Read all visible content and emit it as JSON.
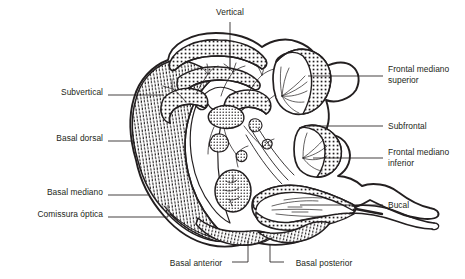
{
  "figure": {
    "type": "anatomical-cross-section",
    "background_color": "#ffffff",
    "ink_color": "#231f20",
    "labels": [
      {
        "id": "vertical",
        "text": "Vertical",
        "side": "top",
        "x": 230,
        "y": 12,
        "anchor": "center",
        "leader": [
          [
            230,
            22
          ],
          [
            230,
            47
          ]
        ]
      },
      {
        "id": "subvertical",
        "text": "Subvertical",
        "side": "left",
        "x": 103,
        "y": 92,
        "anchor": "end",
        "leader": [
          [
            108,
            95
          ],
          [
            163,
            95
          ]
        ]
      },
      {
        "id": "basal-dorsal",
        "text": "Basal dorsal",
        "side": "left",
        "x": 103,
        "y": 138,
        "anchor": "end",
        "leader": [
          [
            108,
            141
          ],
          [
            133,
            141
          ]
        ]
      },
      {
        "id": "basal-mediano",
        "text": "Basal mediano",
        "side": "left",
        "x": 103,
        "y": 192,
        "anchor": "end",
        "leader": [
          [
            108,
            195
          ],
          [
            148,
            195
          ]
        ]
      },
      {
        "id": "comissura-optica",
        "text": "Comissura óptica",
        "side": "left",
        "x": 103,
        "y": 214,
        "anchor": "end",
        "leader": [
          [
            108,
            217
          ],
          [
            168,
            217
          ],
          [
            168,
            205
          ]
        ]
      },
      {
        "id": "frontal-mediano-superior",
        "text": "Frontal mediano superior",
        "lines": [
          "Frontal mediano",
          "superior"
        ],
        "side": "right",
        "x": 388,
        "y": 70,
        "anchor": "start",
        "leader": [
          [
            308,
            76
          ],
          [
            383,
            76
          ]
        ]
      },
      {
        "id": "subfrontal",
        "text": "Subfrontal",
        "side": "right",
        "x": 388,
        "y": 122,
        "anchor": "start",
        "leader": [
          [
            307,
            126
          ],
          [
            383,
            126
          ]
        ]
      },
      {
        "id": "frontal-mediano-inferior",
        "text": "Frontal mediano inferior",
        "lines": [
          "Frontal mediano",
          "inferior"
        ],
        "side": "right",
        "x": 388,
        "y": 152,
        "anchor": "start",
        "leader": [
          [
            313,
            158
          ],
          [
            383,
            158
          ]
        ]
      },
      {
        "id": "bucal",
        "text": "Bucal",
        "side": "right",
        "x": 388,
        "y": 202,
        "anchor": "start",
        "leader": [
          [
            300,
            205
          ],
          [
            383,
            205
          ]
        ]
      },
      {
        "id": "basal-anterior",
        "text": "Basal anterior",
        "side": "bottom",
        "x": 196,
        "y": 264,
        "anchor": "center",
        "leader": [
          [
            232,
            262
          ],
          [
            248,
            262
          ],
          [
            248,
            240
          ]
        ]
      },
      {
        "id": "basal-posterior",
        "text": "Basal posterior",
        "side": "bottom",
        "x": 322,
        "y": 264,
        "anchor": "center",
        "leader": [
          [
            284,
            262
          ],
          [
            270,
            262
          ],
          [
            270,
            245
          ]
        ]
      }
    ]
  }
}
